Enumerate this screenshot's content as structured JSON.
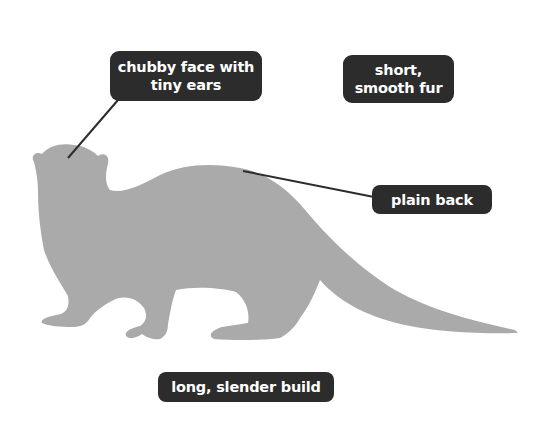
{
  "diagram": {
    "silhouette_color": "#aaaaaa",
    "label_background": "#2c2c2c",
    "label_text_color": "#ffffff",
    "leader_line_color": "#2c2c2c"
  },
  "labels": {
    "face": {
      "line1": "chubby face with",
      "line2": "tiny ears"
    },
    "fur": {
      "line1": "short,",
      "line2": "smooth fur"
    },
    "back": {
      "text": "plain back"
    },
    "build": {
      "text": "long, slender build"
    }
  }
}
